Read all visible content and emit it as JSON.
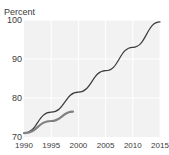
{
  "figure": {
    "title_remnant": "",
    "axis_title": "Percent"
  },
  "chart_data": {
    "type": "line",
    "title": "",
    "subtitle": "",
    "xlabel": "",
    "ylabel": "Percent",
    "xlim": [
      1990,
      2015
    ],
    "ylim": [
      70,
      100
    ],
    "xticks": [
      "1990",
      "1995",
      "2000",
      "2005",
      "2010",
      "2015"
    ],
    "xtick_values": [
      1990,
      1995,
      2000,
      2005,
      2010,
      2015
    ],
    "yticks": [
      "70",
      "80",
      "90",
      "100"
    ],
    "ytick_values": [
      70,
      80,
      90,
      100
    ],
    "grid": true,
    "grid_color": "#ffffff",
    "plot_background": "#f2f2f2",
    "legend": null,
    "legend_position": "none",
    "annotations": [],
    "series": [
      {
        "name": "long-projection",
        "color": "#3a3a3a",
        "width": 1.2,
        "x": [
          1990,
          1995,
          2000,
          2005,
          2010,
          2015
        ],
        "values": [
          71.0,
          76.4,
          81.5,
          87.0,
          93.0,
          99.5
        ]
      },
      {
        "name": "short-trend",
        "color": "#808080",
        "width": 2.2,
        "x": [
          1990,
          1995,
          1999
        ],
        "values": [
          71.0,
          74.1,
          76.5
        ]
      }
    ]
  }
}
